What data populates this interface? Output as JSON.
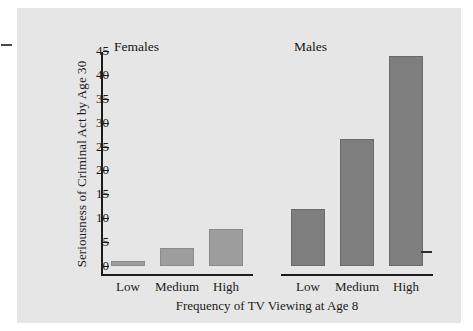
{
  "chart_data": {
    "type": "bar",
    "title": "",
    "xlabel": "Frequency of TV Viewing at Age 8",
    "ylabel": "Seriousness of Criminal Act by Age 30",
    "categories": [
      "Low",
      "Medium",
      "High"
    ],
    "groups": [
      "Females",
      "Males"
    ],
    "series": [
      {
        "name": "Females",
        "values": [
          1,
          3.8,
          7.8
        ]
      },
      {
        "name": "Males",
        "values": [
          12,
          26.5,
          44
        ]
      }
    ],
    "ylim": [
      0,
      47
    ],
    "yticks": [
      0,
      5,
      10,
      15,
      20,
      25,
      30,
      35,
      40,
      45
    ],
    "ytick_labels": [
      "0",
      "5",
      "10",
      "15",
      "20",
      "25",
      "30",
      "35",
      "40",
      "45"
    ],
    "grid": false,
    "legend": "none",
    "colors": {
      "females_bar": "#9d9d9d",
      "males_bar": "#7e7e7e",
      "panel_background": "#e6e6e6",
      "axis": "#1c1c1c",
      "text": "#1a1a1a"
    }
  },
  "panel": {
    "group_headings": {
      "females": "Females",
      "males": "Males"
    }
  }
}
